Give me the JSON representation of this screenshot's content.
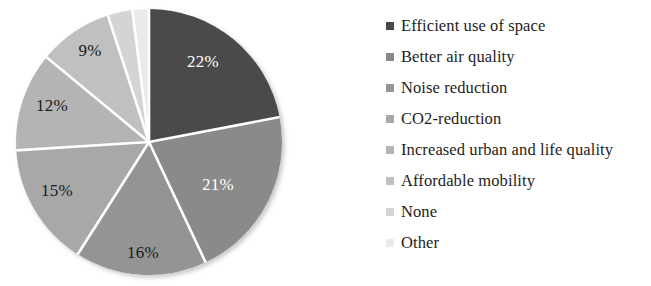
{
  "chart_data": {
    "type": "pie",
    "title": "",
    "subtitle": "",
    "xlabel": "",
    "ylabel": "",
    "legend_position": "right",
    "grid": false,
    "start_angle_deg": 0,
    "direction": "clockwise",
    "categories": [
      "Efficient use of space",
      "Better air quality",
      "Noise reduction",
      "CO2-reduction",
      "Increased urban and life quality",
      "Affordable mobility",
      "None",
      "Other"
    ],
    "values": [
      22,
      21,
      16,
      15,
      12,
      9,
      3,
      2
    ],
    "value_unit": "%",
    "data_labels": [
      "22%",
      "21%",
      "16%",
      "15%",
      "12%",
      "9%",
      "",
      ""
    ],
    "slice_colors": [
      "#4a4a4a",
      "#8a8a8a",
      "#949494",
      "#a8a8a8",
      "#b4b4b4",
      "#c0c0c0",
      "#d4d4d4",
      "#eaeaea"
    ],
    "label_text_colors": [
      "#ffffff",
      "#ffffff",
      "#1a1a1a",
      "#1a1a1a",
      "#1a1a1a",
      "#1a1a1a",
      "#1a1a1a",
      "#1a1a1a"
    ],
    "separator_color": "#ffffff"
  },
  "pie": {
    "center_x": 149,
    "center_y": 142,
    "radius": 133,
    "slices": [
      {
        "label": "Efficient use of space",
        "value": 22,
        "display": "22%",
        "color": "#4a4a4a",
        "text_color": "#ffffff",
        "label_x": 203,
        "label_y": 63
      },
      {
        "label": "Better air quality",
        "value": 21,
        "display": "21%",
        "color": "#8a8a8a",
        "text_color": "#ffffff",
        "label_x": 218,
        "label_y": 186
      },
      {
        "label": "Noise reduction",
        "value": 16,
        "display": "16%",
        "color": "#949494",
        "text_color": "#1a1a1a",
        "label_x": 143,
        "label_y": 254
      },
      {
        "label": "CO2-reduction",
        "value": 15,
        "display": "15%",
        "color": "#a8a8a8",
        "text_color": "#1a1a1a",
        "label_x": 57,
        "label_y": 192
      },
      {
        "label": "Increased urban and life quality",
        "value": 12,
        "display": "12%",
        "color": "#b4b4b4",
        "text_color": "#1a1a1a",
        "label_x": 52,
        "label_y": 107
      },
      {
        "label": "Affordable mobility",
        "value": 9,
        "display": "9%",
        "color": "#c0c0c0",
        "text_color": "#1a1a1a",
        "label_x": 90,
        "label_y": 52
      },
      {
        "label": "None",
        "value": 3,
        "display": "",
        "color": "#d4d4d4",
        "text_color": "#1a1a1a",
        "label_x": 0,
        "label_y": 0
      },
      {
        "label": "Other",
        "value": 2,
        "display": "",
        "color": "#eaeaea",
        "text_color": "#1a1a1a",
        "label_x": 0,
        "label_y": 0
      }
    ]
  },
  "legend": {
    "items": [
      {
        "label": "Efficient use of space",
        "color": "#4a4a4a"
      },
      {
        "label": "Better air quality",
        "color": "#8a8a8a"
      },
      {
        "label": "Noise reduction",
        "color": "#949494"
      },
      {
        "label": "CO2-reduction",
        "color": "#a8a8a8"
      },
      {
        "label": "Increased urban and life quality",
        "color": "#b4b4b4"
      },
      {
        "label": "Affordable mobility",
        "color": "#c0c0c0"
      },
      {
        "label": "None",
        "color": "#d4d4d4"
      },
      {
        "label": "Other",
        "color": "#eaeaea"
      }
    ]
  }
}
